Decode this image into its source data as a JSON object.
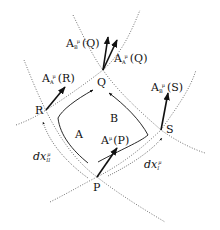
{
  "diagram": {
    "points": {
      "P": {
        "label": "P"
      },
      "Q": {
        "label": "Q"
      },
      "R": {
        "label": "R"
      },
      "S": {
        "label": "S"
      }
    },
    "paths": {
      "A": {
        "label": "A"
      },
      "B": {
        "label": "B"
      }
    },
    "vectors": {
      "AP": {
        "main": "A",
        "sup": "μ",
        "arg": "(P)"
      },
      "AR": {
        "main": "A",
        "sub": "A",
        "sup": "μ",
        "arg": "(R)"
      },
      "AQ_A": {
        "main": "A",
        "sub": "A",
        "sup": "μ",
        "arg": "(Q)"
      },
      "AQ_B": {
        "main": "A",
        "sub": "B",
        "sup": "μ",
        "arg": "(Q)"
      },
      "AS": {
        "main": "A",
        "sub": "B",
        "sup": "μ",
        "arg": "(S)"
      }
    },
    "displacements": {
      "dx1": {
        "main": "dx",
        "sub": "I",
        "sup": "μ"
      },
      "dx2": {
        "main": "dx",
        "sub": "II",
        "sup": "μ"
      }
    },
    "colors": {
      "ink": "#111111",
      "dotted": "#333333",
      "background": "#ffffff"
    }
  }
}
